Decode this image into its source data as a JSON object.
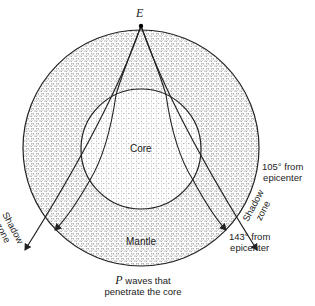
{
  "diagram": {
    "epicenter_label": "E",
    "core_label": "Core",
    "mantle_label": "Mantle",
    "left_shadow": [
      "Shadow",
      "zone"
    ],
    "right_shadow": [
      "Shadow",
      "zone"
    ],
    "label_105": [
      "105° from",
      "epicenter"
    ],
    "label_143": [
      "143° from",
      "epicenter"
    ],
    "p_waves_italic": "P",
    "p_waves_rest": " waves that",
    "p_waves_line2": "penetrate the core"
  }
}
